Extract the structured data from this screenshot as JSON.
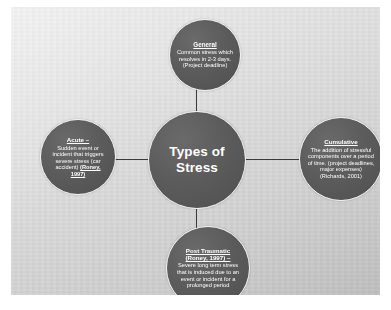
{
  "diagram": {
    "center": {
      "label": "Types of Stress"
    },
    "nodes": {
      "top": {
        "title": "General",
        "body": "Common stress which resolves in 2-3 days. (Project deadline)"
      },
      "left": {
        "title": "Acute –",
        "body": "Sudden event or incident that triggers severe stress (car accident) ",
        "citation": "(Roney, 1997)"
      },
      "right": {
        "title": "Cumulative",
        "body": "The addition of stressful components over a period of time.  (project deadlines, major expenses) (Richards, 2001)"
      },
      "bottom": {
        "title": "Post Traumatic (Roney, 1997) –",
        "body": "Severe long term stress that is induced due to an event or incident for a prolonged period"
      }
    },
    "colors": {
      "node_fill": "#5c5c5c",
      "node_border": "#f2f2f2",
      "node_text": "#ffffff",
      "connector": "#3a3a3a",
      "slide_background": "#dcdcdc",
      "page_background": "#ffffff"
    }
  }
}
